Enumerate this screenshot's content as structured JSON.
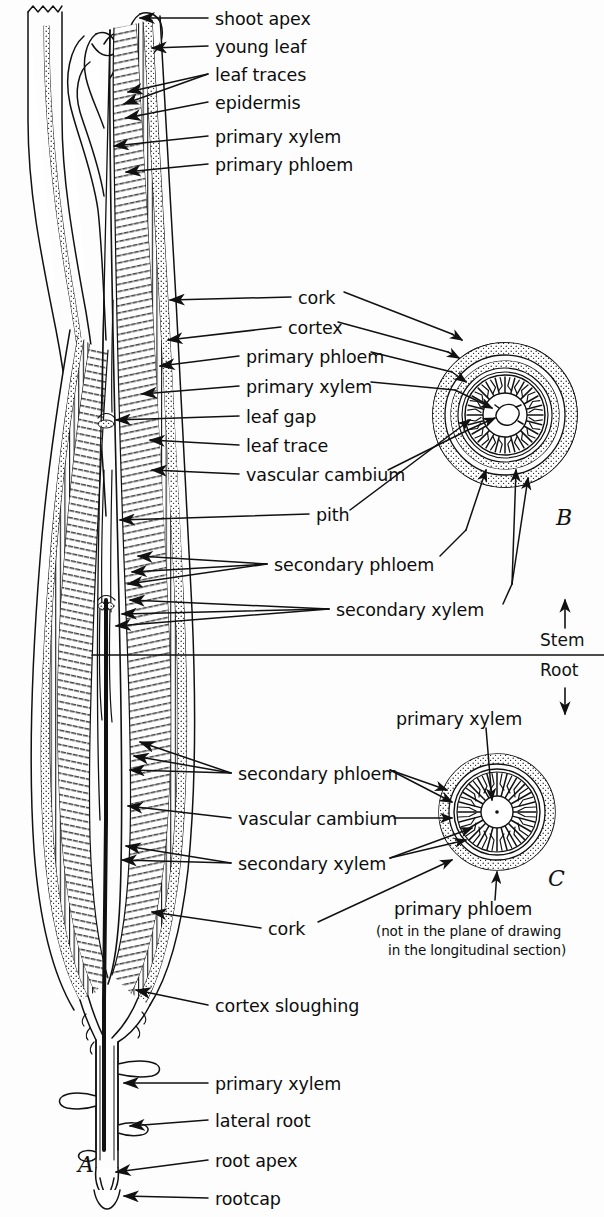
{
  "figure": {
    "background": "#fdfdfd",
    "ink": "#111111"
  },
  "panels": [
    {
      "id": "A",
      "label": "A",
      "x": 78,
      "y": 1155,
      "desc": "longitudinal section of whole plant axis"
    },
    {
      "id": "B",
      "label": "B",
      "x": 556,
      "y": 519,
      "desc": "stem cross section"
    },
    {
      "id": "C",
      "label": "C",
      "x": 548,
      "y": 880,
      "desc": "root cross section"
    }
  ],
  "divider": {
    "up_arrow": "↑",
    "stem_label": "Stem",
    "root_label": "Root",
    "down_arrow": "↓",
    "line_y": 655,
    "line_x1": 92,
    "line_x2": 604
  },
  "labels": [
    {
      "id": "shoot-apex",
      "text": "shoot apex",
      "x": 215,
      "y": 10
    },
    {
      "id": "young-leaf",
      "text": "young leaf",
      "x": 215,
      "y": 38
    },
    {
      "id": "leaf-traces",
      "text": "leaf traces",
      "x": 215,
      "y": 66
    },
    {
      "id": "epidermis",
      "text": "epidermis",
      "x": 215,
      "y": 94
    },
    {
      "id": "primary-xylem-1",
      "text": "primary xylem",
      "x": 215,
      "y": 128
    },
    {
      "id": "primary-phloem-1",
      "text": "primary phloem",
      "x": 215,
      "y": 156
    },
    {
      "id": "cork-1",
      "text": "cork",
      "x": 298,
      "y": 289
    },
    {
      "id": "cortex",
      "text": "cortex",
      "x": 288,
      "y": 319
    },
    {
      "id": "primary-phloem-2",
      "text": "primary phloem",
      "x": 246,
      "y": 348
    },
    {
      "id": "primary-xylem-2",
      "text": "primary xylem",
      "x": 246,
      "y": 378
    },
    {
      "id": "leaf-gap",
      "text": "leaf gap",
      "x": 246,
      "y": 408
    },
    {
      "id": "leaf-trace",
      "text": "leaf trace",
      "x": 246,
      "y": 437
    },
    {
      "id": "vascular-cambium-1",
      "text": "vascular cambium",
      "x": 246,
      "y": 466
    },
    {
      "id": "pith",
      "text": "pith",
      "x": 316,
      "y": 506
    },
    {
      "id": "secondary-phloem-1",
      "text": "secondary phloem",
      "x": 274,
      "y": 556
    },
    {
      "id": "secondary-xylem-1",
      "text": "secondary xylem",
      "x": 336,
      "y": 601
    },
    {
      "id": "primary-xylem-3",
      "text": "primary xylem",
      "x": 396,
      "y": 710
    },
    {
      "id": "secondary-phloem-2",
      "text": "secondary phloem",
      "x": 238,
      "y": 765
    },
    {
      "id": "vascular-cambium-2",
      "text": "vascular cambium",
      "x": 238,
      "y": 810
    },
    {
      "id": "secondary-xylem-2",
      "text": "secondary xylem",
      "x": 238,
      "y": 855
    },
    {
      "id": "cork-2",
      "text": "cork",
      "x": 268,
      "y": 920
    },
    {
      "id": "cortex-sloughing",
      "text": "cortex sloughing",
      "x": 215,
      "y": 997
    },
    {
      "id": "primary-xylem-4",
      "text": "primary xylem",
      "x": 215,
      "y": 1075
    },
    {
      "id": "lateral-root",
      "text": "lateral root",
      "x": 215,
      "y": 1112
    },
    {
      "id": "root-apex",
      "text": "root apex",
      "x": 215,
      "y": 1152
    },
    {
      "id": "rootcap",
      "text": "rootcap",
      "x": 215,
      "y": 1190
    }
  ],
  "panel_c_caption": {
    "main": "primary phloem",
    "note_line1": "(not in the plane of drawing",
    "note_line2": "in the longitudinal section)",
    "x": 486,
    "y": 908
  },
  "icons": {
    "arrow_head": "leader-arrow-icon",
    "up_arrow": "up-arrow-icon",
    "down_arrow": "down-arrow-icon"
  },
  "anatomy_terms": [
    "shoot apex",
    "young leaf",
    "leaf traces",
    "epidermis",
    "primary xylem",
    "primary phloem",
    "cork",
    "cortex",
    "leaf gap",
    "leaf trace",
    "vascular cambium",
    "pith",
    "secondary phloem",
    "secondary xylem",
    "cortex sloughing",
    "lateral root",
    "root apex",
    "rootcap"
  ]
}
